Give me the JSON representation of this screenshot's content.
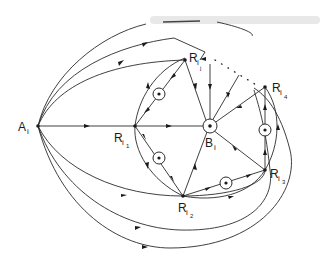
{
  "figure": {
    "type": "directed-graph",
    "ink_color": "#2a2a2a",
    "background": "#ffffff"
  },
  "nodes": {
    "A": {
      "label": "A",
      "sub": "i"
    },
    "R1": {
      "label": "R",
      "sub": "i",
      "subsub": "1"
    },
    "Rj": {
      "label": "R",
      "sub": "i",
      "subsub": "j"
    },
    "R4": {
      "label": "R",
      "sub": "i",
      "subsub": "4"
    },
    "R3": {
      "label": "R",
      "sub": "i",
      "subsub": "3"
    },
    "R2": {
      "label": "R",
      "sub": "i",
      "subsub": "2"
    },
    "B": {
      "label": "B",
      "sub": "i"
    }
  },
  "marked_edges": [
    "Rj-R1",
    "R1-R2",
    "R2-R3",
    "R3-R4"
  ],
  "center_marker": "B",
  "dotted_connection": "Rj...R4"
}
